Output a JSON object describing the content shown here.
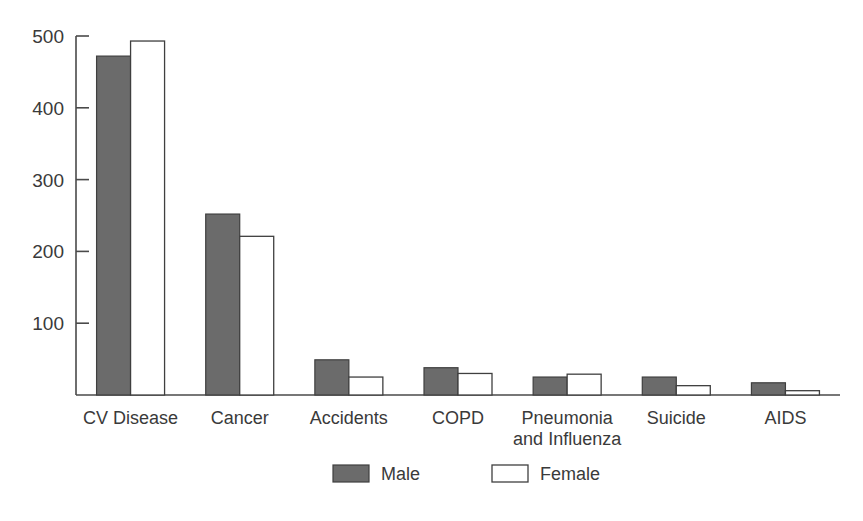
{
  "chart_data": {
    "type": "bar",
    "title": "",
    "subtitle": "",
    "xlabel": "",
    "ylabel": "",
    "ylim": [
      0,
      500
    ],
    "yticks": [
      100,
      200,
      300,
      400,
      500
    ],
    "ytick_labels": [
      "100",
      "200",
      "300",
      "400",
      "500"
    ],
    "grid": false,
    "legend_position": "bottom-center",
    "categories": [
      "CV Disease",
      "Cancer",
      "Accidents",
      "COPD",
      "Pneumonia and Influenza",
      "Suicide",
      "AIDS"
    ],
    "category_lines": [
      [
        "CV Disease"
      ],
      [
        "Cancer"
      ],
      [
        "Accidents"
      ],
      [
        "COPD"
      ],
      [
        "Pneumonia",
        "and Influenza"
      ],
      [
        "Suicide"
      ],
      [
        "AIDS"
      ]
    ],
    "series": [
      {
        "name": "Male",
        "color": "#6b6b6b",
        "values": [
          472,
          252,
          49,
          38,
          25,
          25,
          17
        ]
      },
      {
        "name": "Female",
        "color": "#ffffff",
        "values": [
          493,
          221,
          25,
          30,
          29,
          13,
          6
        ]
      }
    ],
    "legend": [
      {
        "label": "Male",
        "swatch": "filled-gray"
      },
      {
        "label": "Female",
        "swatch": "open-white"
      }
    ],
    "colors": {
      "male_fill": "#6b6b6b",
      "female_fill": "#ffffff",
      "outline": "#3f3f3f",
      "axis": "#4a4a4a",
      "text": "#3a3a3a",
      "background": "#ffffff"
    }
  }
}
